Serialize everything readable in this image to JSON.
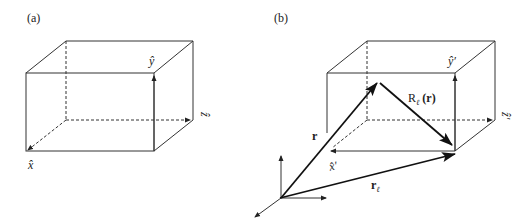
{
  "panels": [
    {
      "id": "a",
      "label": "(a)",
      "axes": {
        "x": "x̂",
        "y": "ŷ",
        "z": "ẑ"
      }
    },
    {
      "id": "b",
      "label": "(b)",
      "axes": {
        "x": "x̂′",
        "y": "ŷ′",
        "z": "ẑ′"
      },
      "vectors": {
        "r": "r",
        "r_l": "r",
        "r_l_sub": "ℓ",
        "R": "R",
        "R_sub": "ℓ",
        "R_arg": "(r)"
      }
    }
  ],
  "colors": {
    "line": "#333333",
    "vector": "#1a1a1a"
  }
}
